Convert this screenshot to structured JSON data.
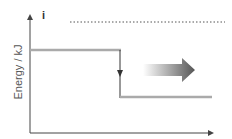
{
  "diagram": {
    "type": "energy-level-diagram",
    "ylabel": "Energy / kJ",
    "xlabel": "",
    "top_label": "i",
    "levels": [
      {
        "name": "initial",
        "relative_height": "high"
      },
      {
        "name": "final",
        "relative_height": "low"
      }
    ],
    "transition": "downward arrow from initial to final level",
    "direction_arrow": "right",
    "colors": {
      "axis": "#444444",
      "level_line": "#aaaaaa",
      "arrow_gradient_start": "#ffffff",
      "arrow_gradient_end": "#555555"
    }
  }
}
